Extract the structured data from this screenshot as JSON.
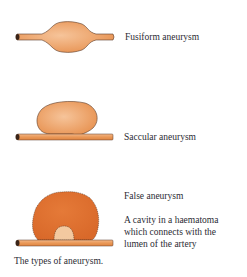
{
  "diagram": {
    "caption": "The types of aneurysm.",
    "items": [
      {
        "id": "fusiform",
        "label": "Fusiform aneurysm"
      },
      {
        "id": "saccular",
        "label": "Saccular aneurysm"
      },
      {
        "id": "false",
        "label": "False aneurysm",
        "description_lines": [
          "A cavity in a haematoma",
          "which connects with the",
          "lumen of the artery"
        ]
      }
    ],
    "colors": {
      "vessel": "#e8924f",
      "vessel_light": "#f2b483",
      "haematoma": "#e0722e",
      "cavity": "#f3c9a0",
      "outline": "#5a3a28"
    }
  }
}
